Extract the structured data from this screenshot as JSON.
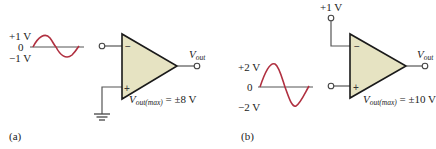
{
  "colors": {
    "opamp_fill": "#e6e3c2",
    "sine_wave": "#b03040",
    "wire": "#555555"
  },
  "circuit_a": {
    "caption": "(a)",
    "input_signal": {
      "pos_peak_label": "+1 V",
      "zero_label": "0",
      "neg_peak_label": "−1 V"
    },
    "inverting_input_sign": "−",
    "noninverting_input_sign": "+",
    "noninverting_connection": "ground",
    "output_label_main": "V",
    "output_label_sub": "out",
    "vmax_label_main": "V",
    "vmax_label_sub": "out(max)",
    "vmax_value": " = ±8 V"
  },
  "circuit_b": {
    "caption": "(b)",
    "reference_label": "+1 V",
    "input_signal": {
      "pos_peak_label": "+2 V",
      "zero_label": "0",
      "neg_peak_label": "−2 V"
    },
    "inverting_input_sign": "−",
    "noninverting_input_sign": "+",
    "output_label_main": "V",
    "output_label_sub": "out",
    "vmax_label_main": "V",
    "vmax_label_sub": "out(max)",
    "vmax_value": " = ±10 V"
  }
}
